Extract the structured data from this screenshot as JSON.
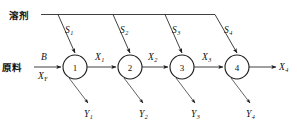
{
  "diagram": {
    "feed_label": "原料",
    "solvent_label": "溶剂",
    "feed_flow_symbol": "B",
    "feed_comp_symbol": "X",
    "feed_comp_subscript": "F",
    "stages": [
      {
        "number": "1",
        "cx": 75,
        "cy": 67,
        "r": 12
      },
      {
        "number": "2",
        "cx": 130,
        "cy": 67,
        "r": 12
      },
      {
        "number": "3",
        "cx": 182,
        "cy": 67,
        "r": 12
      },
      {
        "number": "4",
        "cx": 237,
        "cy": 67,
        "r": 12
      }
    ],
    "solvent_streams": [
      {
        "symbol": "S",
        "subscript": "1"
      },
      {
        "symbol": "S",
        "subscript": "2"
      },
      {
        "symbol": "S",
        "subscript": "3"
      },
      {
        "symbol": "S",
        "subscript": "4"
      }
    ],
    "raffinate_streams": [
      {
        "symbol": "X",
        "subscript": "1"
      },
      {
        "symbol": "X",
        "subscript": "2"
      },
      {
        "symbol": "X",
        "subscript": "3"
      },
      {
        "symbol": "X",
        "subscript": "4"
      }
    ],
    "extract_streams": [
      {
        "symbol": "Y",
        "subscript": "1"
      },
      {
        "symbol": "Y",
        "subscript": "2"
      },
      {
        "symbol": "Y",
        "subscript": "3"
      },
      {
        "symbol": "Y",
        "subscript": "4"
      }
    ],
    "colors": {
      "line": "#2b2b2b",
      "text": "#111111",
      "background": "#ffffff"
    }
  }
}
